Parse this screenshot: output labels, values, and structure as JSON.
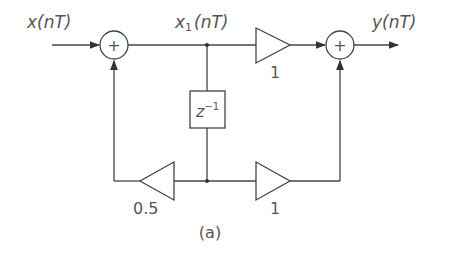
{
  "diagram": {
    "input_label": "x(nT)",
    "intermediate_label_main": "x",
    "intermediate_label_sub": "1",
    "intermediate_label_rest": "(nT)",
    "output_label": "y(nT)",
    "adder_symbol": "+",
    "delay_label_base": "z",
    "delay_label_exp": "−1",
    "gain_top": "1",
    "gain_bottom_right": "1",
    "gain_feedback": "0.5",
    "caption": "(a)"
  }
}
